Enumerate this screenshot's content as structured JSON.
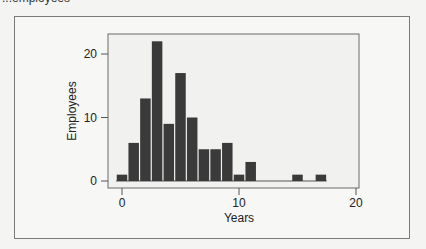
{
  "caption_top": "...employees",
  "chart_data": {
    "type": "bar",
    "subtype": "histogram",
    "title": "",
    "xlabel": "Years",
    "ylabel": "Employees",
    "x": [
      0,
      1,
      2,
      3,
      4,
      5,
      6,
      7,
      8,
      9,
      10,
      11,
      12,
      13,
      14,
      15,
      16,
      17
    ],
    "values": [
      1,
      6,
      13,
      22,
      9,
      17,
      10,
      5,
      5,
      6,
      1,
      3,
      0,
      0,
      0,
      1,
      0,
      1
    ],
    "bin_width": 1,
    "xlim": [
      -1.2,
      20.2
    ],
    "ylim": [
      -1,
      24
    ],
    "xticks": [
      0,
      10,
      20
    ],
    "yticks": [
      0,
      10,
      20
    ],
    "grid": false,
    "legend": null,
    "bar_color": "#3a3a3a"
  },
  "axis": {
    "x_tick_labels": [
      "0",
      "10",
      "20"
    ],
    "y_tick_labels": [
      "0",
      "10",
      "20"
    ]
  }
}
